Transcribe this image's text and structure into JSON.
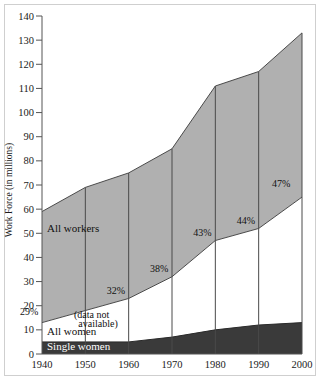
{
  "chart_data": {
    "type": "area",
    "title": "",
    "xlabel": "",
    "ylabel": "Work Force (in millions)",
    "x": [
      1940,
      1950,
      1960,
      1970,
      1980,
      1990,
      2000
    ],
    "xtick_labels": [
      "1940",
      "1950",
      "1960",
      "1970",
      "1980",
      "1990",
      "2000"
    ],
    "xlim": [
      1940,
      2000
    ],
    "ylim": [
      0,
      140
    ],
    "ytick_labels": [
      "0",
      "10",
      "20",
      "30",
      "40",
      "50",
      "60",
      "70",
      "80",
      "90",
      "100",
      "110",
      "120",
      "130",
      "140"
    ],
    "ytick_values": [
      0,
      10,
      20,
      30,
      40,
      50,
      60,
      70,
      80,
      90,
      100,
      110,
      120,
      130,
      140
    ],
    "grid": "vertical-only",
    "legend_position": "inline-annotations",
    "series": [
      {
        "name": "All workers",
        "label": "All workers",
        "color": "#b0b0b0",
        "values": [
          59,
          69,
          75,
          85,
          111,
          117,
          133
        ]
      },
      {
        "name": "All women",
        "label": "All women",
        "color": "#ffffff",
        "values": [
          13,
          18,
          23,
          32,
          47,
          52,
          65
        ]
      },
      {
        "name": "Single women",
        "label": "Single women",
        "color": "#3a3a3a",
        "values": [
          5,
          5,
          5,
          7,
          10,
          12,
          13
        ]
      }
    ],
    "annotations": [
      {
        "text": "29%",
        "x": 1940,
        "y": 16
      },
      {
        "text": "32%",
        "x": 1960,
        "y": 25
      },
      {
        "text": "38%",
        "x": 1970,
        "y": 34
      },
      {
        "text": "43%",
        "x": 1980,
        "y": 49
      },
      {
        "text": "44%",
        "x": 1990,
        "y": 54
      },
      {
        "text": "47%",
        "x": 2000,
        "y": 69
      },
      {
        "text": "(data not",
        "x": 1952,
        "y": 15
      },
      {
        "text": "available)",
        "x": 1953,
        "y": 11
      }
    ],
    "colors": {
      "all_workers_fill": "#b0b0b0",
      "all_women_fill": "#ffffff",
      "single_women_fill": "#3a3a3a",
      "axis": "#555555",
      "gridline": "#4a4a4a",
      "frame": "#cfcfcf"
    }
  }
}
